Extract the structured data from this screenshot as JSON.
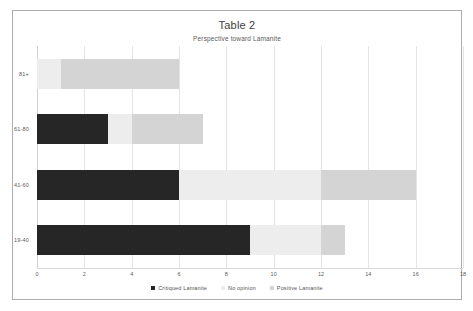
{
  "chart_data": {
    "type": "bar",
    "orientation": "horizontal",
    "stacked": true,
    "title": "Table 2",
    "subtitle": "Perspective toward Lamanite",
    "xlabel": "",
    "ylabel": "",
    "xlim": [
      0,
      18
    ],
    "xticks": [
      0,
      2,
      4,
      6,
      8,
      10,
      12,
      14,
      16,
      18
    ],
    "grid": true,
    "legend_position": "bottom",
    "categories": [
      "81+",
      "61-80",
      "41-60",
      "19-40"
    ],
    "series": [
      {
        "name": "Critiqued Lamanite",
        "color": "#262626",
        "values": [
          0,
          3,
          6,
          9
        ]
      },
      {
        "name": "No opinion",
        "color": "#ededed",
        "values": [
          1,
          1,
          6,
          3
        ]
      },
      {
        "name": "Positive Lamanite",
        "color": "#d4d4d4",
        "values": [
          5,
          3,
          4,
          1
        ]
      }
    ],
    "row_totals": [
      6,
      7,
      16,
      13
    ]
  },
  "legend": {
    "items": [
      {
        "label": "Critiqued Lamanite",
        "color": "#262626"
      },
      {
        "label": "No opinion",
        "color": "#ededed"
      },
      {
        "label": "Positive Lamanite",
        "color": "#d4d4d4"
      }
    ]
  },
  "colors": {
    "frame_border": "#adadad",
    "gridline": "#e4e4e4",
    "text": "#555555",
    "background": "#ffffff"
  }
}
